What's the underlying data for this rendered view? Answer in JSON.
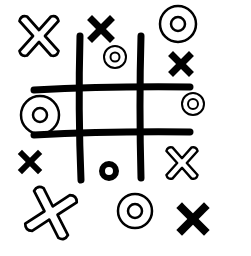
{
  "illustration": {
    "subject": "tic-tac-toe doodle",
    "colors": {
      "ink": "#000000",
      "paper": "#ffffff"
    },
    "grid": {
      "vertical_lines": [
        {
          "x": 80,
          "y1": 36,
          "y2": 180
        },
        {
          "x": 141,
          "y1": 36,
          "y2": 178
        }
      ],
      "horizontal_lines": [
        {
          "y": 88,
          "x1": 34,
          "x2": 190
        },
        {
          "y": 133,
          "x1": 34,
          "x2": 190
        }
      ]
    },
    "marks": [
      {
        "type": "outlined-x",
        "x": 39,
        "y": 36
      },
      {
        "type": "solid-x",
        "x": 101,
        "y": 29
      },
      {
        "type": "outlined-o",
        "x": 115,
        "y": 57
      },
      {
        "type": "outlined-o",
        "x": 178,
        "y": 24
      },
      {
        "type": "solid-x",
        "x": 181,
        "y": 64
      },
      {
        "type": "outlined-o",
        "x": 40,
        "y": 115
      },
      {
        "type": "outlined-o",
        "x": 193,
        "y": 104
      },
      {
        "type": "solid-x",
        "x": 30,
        "y": 162
      },
      {
        "type": "solid-o",
        "x": 109,
        "y": 171
      },
      {
        "type": "outlined-x",
        "x": 182,
        "y": 163
      },
      {
        "type": "outlined-x",
        "x": 51,
        "y": 213
      },
      {
        "type": "outlined-o",
        "x": 135,
        "y": 211
      },
      {
        "type": "solid-x",
        "x": 193,
        "y": 219
      }
    ]
  }
}
